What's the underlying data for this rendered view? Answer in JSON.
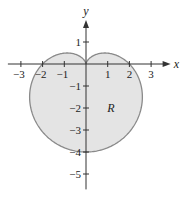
{
  "chart_data": {
    "type": "area",
    "title": "",
    "curve": {
      "description": "cardioid r = 2 - 2 sin(theta)",
      "equation": "r = 2 - 2*sin(theta)",
      "theta_range": [
        0,
        6.283185307
      ]
    },
    "region_label": "R",
    "xlabel": "x",
    "ylabel": "y",
    "xlim": [
      -3.6,
      3.9
    ],
    "ylim": [
      -5.7,
      2.0
    ],
    "x_ticks": [
      -3,
      -2,
      -1,
      1,
      2,
      3
    ],
    "x_tick_labels": [
      "−3",
      "−2",
      "−1",
      "1",
      "2",
      "3"
    ],
    "y_ticks": [
      1,
      -1,
      -2,
      -3,
      -4,
      -5
    ],
    "y_tick_labels": [
      "1",
      "−1",
      "−2",
      "−3",
      "−4",
      "−5"
    ],
    "grid": false,
    "colors": {
      "fill": "#e4e4e4",
      "stroke": "#8a8a8a",
      "axis": "#333333"
    }
  }
}
